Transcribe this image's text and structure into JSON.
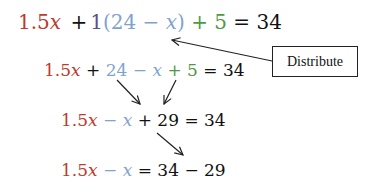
{
  "equations": [
    {
      "id": "original",
      "terms": [
        {
          "text": "1.5",
          "color": "#c0392b"
        },
        {
          "text": "x",
          "color": "#c0392b",
          "italic": true
        },
        {
          "text": "+",
          "color": "#111111"
        },
        {
          "text": "1",
          "color": "#5d4f86"
        },
        {
          "text": "(24 −",
          "color": "#7fa3cf"
        },
        {
          "text": "x",
          "color": "#7fa3cf",
          "italic": true
        },
        {
          "text": ")",
          "color": "#7fa3cf"
        },
        {
          "text": "+ 5",
          "color": "#4e9a43"
        },
        {
          "text": "= 34",
          "color": "#111111"
        }
      ]
    },
    {
      "id": "distributed",
      "terms": [
        {
          "text": "1.5",
          "color": "#c0392b"
        },
        {
          "text": "x",
          "color": "#c0392b",
          "italic": true
        },
        {
          "text": "+",
          "color": "#111111"
        },
        {
          "text": "24 −",
          "color": "#7fa3cf"
        },
        {
          "text": "x",
          "color": "#7fa3cf",
          "italic": true
        },
        {
          "text": "+ 5",
          "color": "#4e9a43"
        },
        {
          "text": "= 34",
          "color": "#111111"
        }
      ]
    },
    {
      "id": "combined",
      "terms": [
        {
          "text": "1.5",
          "color": "#c0392b"
        },
        {
          "text": "x",
          "color": "#c0392b",
          "italic": true
        },
        {
          "text": "−",
          "color": "#7fa3cf"
        },
        {
          "text": "x",
          "color": "#7fa3cf",
          "italic": true
        },
        {
          "text": "+ 29 = 34",
          "color": "#111111"
        }
      ]
    },
    {
      "id": "isolated",
      "terms": [
        {
          "text": "1.5",
          "color": "#c0392b"
        },
        {
          "text": "x",
          "color": "#c0392b",
          "italic": true
        },
        {
          "text": "−",
          "color": "#7fa3cf"
        },
        {
          "text": "x",
          "color": "#7fa3cf",
          "italic": true
        },
        {
          "text": "= 34 − 29",
          "color": "#111111"
        }
      ]
    }
  ],
  "callout": {
    "label": "Distribute",
    "arrow_from": [
      272,
      61
    ],
    "arrow_to": [
      172,
      40
    ]
  },
  "step_arrows": [
    {
      "from": [
        117,
        80
      ],
      "to": [
        140,
        104
      ]
    },
    {
      "from": [
        176,
        80
      ],
      "to": [
        164,
        104
      ]
    },
    {
      "from": [
        157,
        133
      ],
      "to": [
        183,
        155
      ]
    }
  ],
  "colors": {
    "red": "#c0392b",
    "blue": "#7fa3cf",
    "purple": "#5d4f86",
    "green": "#4e9a43",
    "text": "#111111"
  }
}
